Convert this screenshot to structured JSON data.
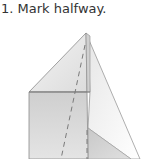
{
  "step": {
    "number": "1.",
    "instruction": "Mark halfway."
  },
  "caption_text": "1. Mark halfway.",
  "diagram": {
    "fold_marks": "dashed-halfway-lines",
    "colors": {
      "stroke": "#8a8a8a",
      "light_face": "#f2f2f2",
      "mid_face": "#d6d6d6",
      "dark_face": "#bdbdbd",
      "dash": "#7a7a7a"
    }
  }
}
